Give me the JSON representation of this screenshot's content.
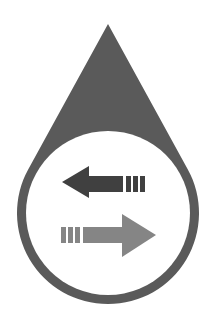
{
  "image": {
    "description": "Water drop icon with two opposing arrows (exchange / transfer)",
    "width": 213,
    "height": 328,
    "background": "#ffffff"
  },
  "icon": {
    "name": "water-exchange-icon",
    "drop": {
      "apex": [
        108,
        24
      ],
      "circle_center": [
        108,
        213
      ],
      "outer_radius": 91,
      "inner_radius": 82,
      "color": "#5a5a5a"
    },
    "arrows": [
      {
        "name": "arrow-left",
        "direction": "left",
        "color": "#404040"
      },
      {
        "name": "arrow-right",
        "direction": "right",
        "color": "#858585"
      }
    ]
  }
}
